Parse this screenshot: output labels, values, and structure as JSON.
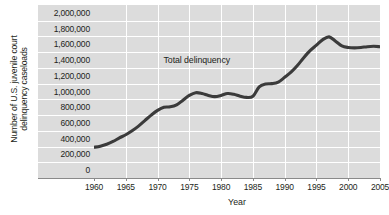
{
  "chart_data": {
    "type": "line",
    "title": "",
    "xlabel": "Year",
    "ylabel": "Number of U.S. juvenile court delinquency caseloads",
    "ylabel_lines": [
      "Number of U.S. juvenile court",
      "delinquency caseloads"
    ],
    "xlim": [
      1960,
      2005
    ],
    "ylim": [
      0,
      2000000
    ],
    "xticks": [
      1960,
      1965,
      1970,
      1975,
      1980,
      1985,
      1990,
      1995,
      2000,
      2005
    ],
    "xtick_labels": [
      "1960",
      "1965",
      "1970",
      "1975",
      "1980",
      "1985",
      "1990",
      "1995",
      "2000",
      "2005"
    ],
    "yticks": [
      0,
      200000,
      400000,
      600000,
      800000,
      1000000,
      1200000,
      1400000,
      1600000,
      1800000,
      2000000
    ],
    "ytick_labels": [
      "0",
      "200,000",
      "400,000",
      "600,000",
      "800,000",
      "1,000,000",
      "1,200,000",
      "1,400,000",
      "1,600,000",
      "1,800,000",
      "2,000,000"
    ],
    "grid": true,
    "grid_color": "#ffffff",
    "plot_background": "#dcdcdc",
    "line_color": "#3b3b3b",
    "legend_position": "inline-annotation",
    "annotations": [
      {
        "text": "Total delinquency",
        "x": 1978.5,
        "y": 1400000
      }
    ],
    "series": [
      {
        "name": "Total delinquency",
        "x": [
          1960,
          1961,
          1962,
          1963,
          1964,
          1965,
          1966,
          1967,
          1968,
          1969,
          1970,
          1971,
          1972,
          1973,
          1974,
          1975,
          1976,
          1977,
          1978,
          1979,
          1980,
          1981,
          1982,
          1983,
          1984,
          1985,
          1986,
          1987,
          1988,
          1989,
          1990,
          1991,
          1992,
          1993,
          1994,
          1995,
          1996,
          1997,
          1998,
          1999,
          2000,
          2001,
          2002,
          2003,
          2004,
          2005
        ],
        "values": [
          290000,
          305000,
          330000,
          365000,
          410000,
          450000,
          500000,
          560000,
          630000,
          700000,
          760000,
          800000,
          805000,
          830000,
          890000,
          950000,
          985000,
          975000,
          950000,
          935000,
          950000,
          975000,
          965000,
          940000,
          925000,
          940000,
          1060000,
          1095000,
          1100000,
          1120000,
          1180000,
          1245000,
          1330000,
          1430000,
          1520000,
          1590000,
          1660000,
          1695000,
          1640000,
          1580000,
          1560000,
          1555000,
          1560000,
          1570000,
          1575000,
          1570000
        ]
      }
    ]
  }
}
